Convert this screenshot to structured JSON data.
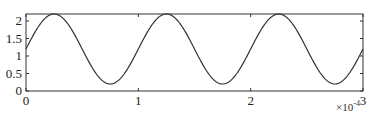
{
  "chart_data": {
    "type": "line",
    "title": "",
    "xlabel": "",
    "ylabel": "",
    "x_multiplier_label": "×10",
    "x_multiplier_exponent": "-4",
    "xlim": [
      0,
      3
    ],
    "ylim": [
      0,
      2.2
    ],
    "xticks": [
      0,
      1,
      2,
      3
    ],
    "xtick_labels": [
      "0",
      "1",
      "2",
      "3"
    ],
    "yticks": [
      0,
      0.5,
      1,
      1.5,
      2
    ],
    "ytick_labels": [
      "0",
      "0.5",
      "1",
      "1.5",
      "2"
    ],
    "grid": false,
    "legend": null,
    "series": [
      {
        "name": "signal",
        "color": "#333333",
        "description": "sinusoid: offset 1.2, amplitude 1.0, period 1 (×1e-4)",
        "x": [
          0,
          0.125,
          0.25,
          0.375,
          0.5,
          0.625,
          0.75,
          0.875,
          1.0,
          1.125,
          1.25,
          1.375,
          1.5,
          1.625,
          1.75,
          1.875,
          2.0,
          2.125,
          2.25,
          2.375,
          2.5,
          2.625,
          2.75,
          2.875,
          3.0
        ],
        "y": [
          1.2,
          1.91,
          2.2,
          1.91,
          1.2,
          0.49,
          0.2,
          0.49,
          1.2,
          1.91,
          2.2,
          1.91,
          1.2,
          0.49,
          0.2,
          0.49,
          1.2,
          1.91,
          2.2,
          1.91,
          1.2,
          0.49,
          0.2,
          0.49,
          1.2
        ]
      }
    ]
  }
}
